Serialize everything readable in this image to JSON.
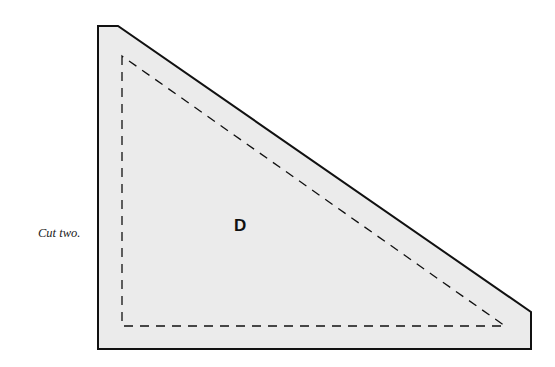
{
  "pattern": {
    "piece_label": "D",
    "instruction": "Cut two.",
    "colors": {
      "fill": "#ebebeb",
      "outline": "#111111",
      "seam_line": "#111111",
      "background": "#ffffff"
    },
    "outer_shape_points": "98,26 118,26 531,312 531,349 98,349",
    "seam_line_points": "122,56 122,326 505,326"
  }
}
